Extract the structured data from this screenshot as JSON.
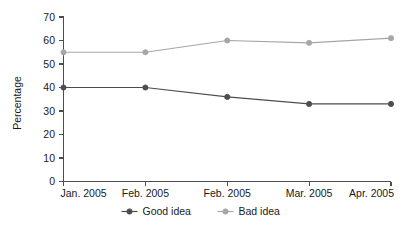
{
  "chart_data": {
    "type": "line",
    "title": "",
    "xlabel": "",
    "ylabel": "Percentage",
    "categories": [
      "Jan. 2005",
      "Feb. 2005",
      "Feb. 2005",
      "Mar. 2005",
      "Apr. 2005"
    ],
    "ylim": [
      0,
      70
    ],
    "yticks": [
      0,
      10,
      20,
      30,
      40,
      50,
      60,
      70
    ],
    "ytick_labels": [
      "0",
      "10",
      "20",
      "30",
      "40",
      "50",
      "60",
      "70"
    ],
    "grid": false,
    "legend_position": "bottom-center",
    "series": [
      {
        "name": "Good idea",
        "values": [
          40,
          40,
          36,
          33,
          33
        ],
        "color": "#4d4d4d",
        "marker": "circle"
      },
      {
        "name": "Bad idea",
        "values": [
          55,
          55,
          60,
          59,
          61
        ],
        "color": "#a6a6a6",
        "marker": "circle"
      }
    ]
  },
  "legend": {
    "items": [
      {
        "label": "Good idea",
        "color": "#4d4d4d"
      },
      {
        "label": "Bad idea",
        "color": "#a6a6a6"
      }
    ]
  },
  "axes": {
    "y_title": "Percentage"
  }
}
